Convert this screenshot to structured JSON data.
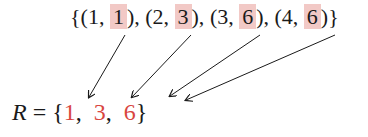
{
  "pairs": {
    "open": "{",
    "close": "}",
    "items": [
      {
        "prefix": "(1, ",
        "value": "1",
        "suffix": "), "
      },
      {
        "prefix": "(2, ",
        "value": "3",
        "suffix": "), "
      },
      {
        "prefix": "(3, ",
        "value": "6",
        "suffix": "), "
      },
      {
        "prefix": "(4, ",
        "value": "6",
        "suffix": ")"
      }
    ]
  },
  "range": {
    "variable": "R",
    "equals": " = ",
    "open": "{",
    "values": [
      "1",
      "3",
      "6"
    ],
    "sep1": ",  ",
    "sep2": ",  ",
    "close": "}"
  },
  "colors": {
    "highlight": "#f2c9c6",
    "result": "#d9463f",
    "text": "#1a1a1a"
  }
}
